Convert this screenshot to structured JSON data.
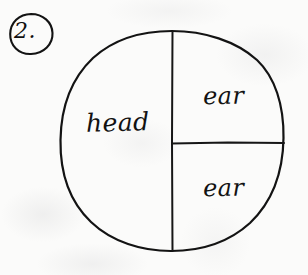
{
  "page": {
    "background_color": "#fbfbfa",
    "ink_color": "#121212",
    "width": 308,
    "height": 275
  },
  "item": {
    "number_label": "2.",
    "circled": true
  },
  "figure": {
    "shape": "circle",
    "style": "hand-drawn",
    "center_x": 172,
    "center_y": 141,
    "radius_x": 112,
    "radius_y": 110,
    "dividers": [
      {
        "name": "vertical-diameter",
        "orientation": "vertical",
        "x": 172,
        "y_start": 32,
        "y_end": 251
      },
      {
        "name": "horizontal-radius",
        "orientation": "horizontal",
        "y": 143,
        "x_start": 172,
        "x_end": 284
      }
    ],
    "regions": [
      {
        "name": "left-half",
        "label": "head",
        "fraction": "1/2",
        "center_x": 118,
        "center_y": 122
      },
      {
        "name": "top-right-quarter",
        "label": "ear",
        "fraction": "1/4",
        "center_x": 228,
        "center_y": 96
      },
      {
        "name": "bottom-right-quarter",
        "label": "ear",
        "fraction": "1/4",
        "center_x": 228,
        "center_y": 188
      }
    ]
  }
}
